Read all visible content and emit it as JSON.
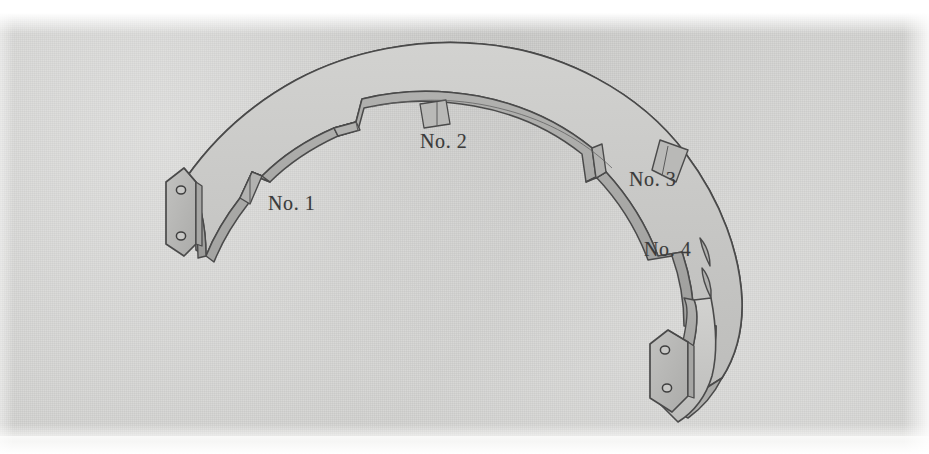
{
  "figure": {
    "background_color": "#d3d3d1",
    "line_color": "#4a4a4a",
    "top_face_color": "#c9c9c7",
    "inner_wall_color": "#a7a7a5",
    "outer_wall_color": "#b5b5b3",
    "bracket_face_color": "#b9b9b7",
    "bracket_edge_color": "#a0a09e",
    "hole_color": "#c4c4c2"
  },
  "labels": [
    {
      "id": "no1",
      "text": "No. 1",
      "x": 268,
      "y": 192
    },
    {
      "id": "no2",
      "text": "No. 2",
      "x": 420,
      "y": 130
    },
    {
      "id": "no3",
      "text": "No. 3",
      "x": 629,
      "y": 168
    },
    {
      "id": "no4",
      "text": "No. 4",
      "x": 644,
      "y": 238
    }
  ],
  "features": [
    {
      "name": "notch-no-1",
      "type": "stepped-notch",
      "label": "No. 1"
    },
    {
      "name": "notch-no-2",
      "type": "stepped-notch",
      "label": "No. 2"
    },
    {
      "name": "notch-no-3",
      "type": "stepped-notch",
      "label": "No. 3"
    },
    {
      "name": "notch-no-4",
      "type": "rounded-notch",
      "label": "No. 4"
    }
  ],
  "brackets": [
    {
      "name": "left-mounting-bracket",
      "holes": 2,
      "shape": "hexagonal-plate"
    },
    {
      "name": "right-mounting-bracket",
      "holes": 2,
      "shape": "hexagonal-plate"
    }
  ]
}
